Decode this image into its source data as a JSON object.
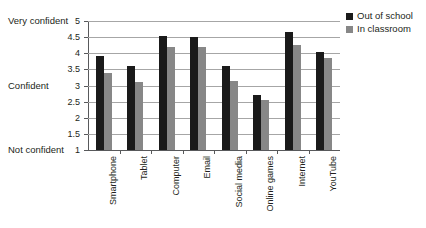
{
  "chart_data": {
    "type": "bar",
    "title": "",
    "xlabel": "",
    "ylabel": "",
    "ylim": [
      1,
      5
    ],
    "ytick_step": 0.5,
    "yticks": [
      "5",
      "4.5",
      "4",
      "3.5",
      "3",
      "2.5",
      "2",
      "1.5",
      "1"
    ],
    "ytick_values": [
      5,
      4.5,
      4,
      3.5,
      3,
      2.5,
      2,
      1.5,
      1
    ],
    "y_anchor_labels": [
      {
        "value": 5,
        "text": "Very confident"
      },
      {
        "value": 3,
        "text": "Confident"
      },
      {
        "value": 1,
        "text": "Not confident"
      }
    ],
    "grid": true,
    "legend_position": "top-right",
    "categories": [
      "Smartphone",
      "Tablet",
      "Computer",
      "Email",
      "Social media",
      "Online games",
      "Internet",
      "YouTube"
    ],
    "series": [
      {
        "name": "Out of school",
        "color": "#1a1a1a",
        "values": [
          3.9,
          3.6,
          4.55,
          4.5,
          3.6,
          2.7,
          4.65,
          4.05
        ]
      },
      {
        "name": "In classroom",
        "color": "#878787",
        "values": [
          3.4,
          3.1,
          4.2,
          4.2,
          3.15,
          2.55,
          4.25,
          3.85
        ]
      }
    ]
  }
}
